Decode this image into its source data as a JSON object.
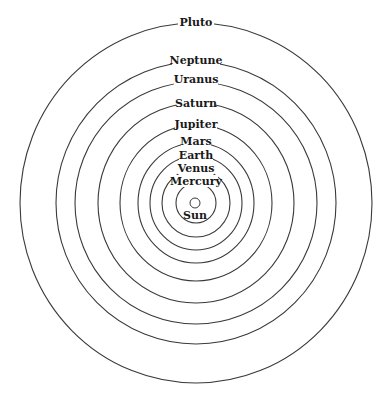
{
  "diagram": {
    "center": {
      "x": 196,
      "y": 203
    },
    "stroke_color": "#3a3a3a",
    "background": "#ffffff",
    "sun": {
      "label": "Sun",
      "radius": 5,
      "label_y": 215
    },
    "orbits": [
      {
        "name": "Mercury",
        "rx": 20,
        "ry": 20,
        "label_y": 181,
        "label_w": 44
      },
      {
        "name": "Venus",
        "rx": 34,
        "ry": 34,
        "label_y": 168,
        "label_w": 36
      },
      {
        "name": "Earth",
        "rx": 46,
        "ry": 47,
        "label_y": 155,
        "label_w": 34
      },
      {
        "name": "Mars",
        "rx": 58,
        "ry": 60,
        "label_y": 141,
        "label_w": 30
      },
      {
        "name": "Jupiter",
        "rx": 76,
        "ry": 78,
        "label_y": 124,
        "label_w": 42
      },
      {
        "name": "Saturn",
        "rx": 98,
        "ry": 100,
        "label_y": 103,
        "label_w": 40
      },
      {
        "name": "Uranus",
        "rx": 121,
        "ry": 121,
        "label_y": 79,
        "label_w": 44
      },
      {
        "name": "Neptune",
        "rx": 140,
        "ry": 141,
        "label_y": 60,
        "label_w": 48
      },
      {
        "name": "Pluto",
        "rx": 176,
        "ry": 180,
        "label_y": 22,
        "label_w": 36
      }
    ]
  }
}
